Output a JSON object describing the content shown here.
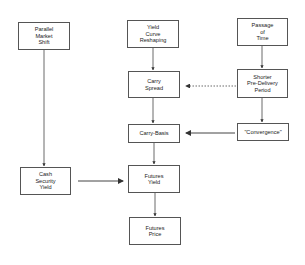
{
  "diagram": {
    "nodes": [
      {
        "id": "parallel",
        "label": "Parallel\nMarket\nShift",
        "x": 18,
        "y": 22,
        "w": 52,
        "h": 28
      },
      {
        "id": "yield_curve",
        "label": "Yield\nCurve\nReshaping",
        "x": 127,
        "y": 20,
        "w": 52,
        "h": 28
      },
      {
        "id": "passage",
        "label": "Passage\nof\nTime",
        "x": 237,
        "y": 18,
        "w": 51,
        "h": 28
      },
      {
        "id": "carry_spread",
        "label": "Carry\nSpread",
        "x": 128,
        "y": 71,
        "w": 52,
        "h": 27
      },
      {
        "id": "shorter",
        "label": "Shorter\nPre-Delivery\nPeriod",
        "x": 237,
        "y": 69,
        "w": 51,
        "h": 29
      },
      {
        "id": "carry_basis",
        "label": "Carry-Basis",
        "x": 128,
        "y": 124,
        "w": 52,
        "h": 19
      },
      {
        "id": "convergence",
        "label": "\"Convergence\"",
        "x": 237,
        "y": 123,
        "w": 52,
        "h": 18
      },
      {
        "id": "cash",
        "label": "Cash\nSecurity\nYield",
        "x": 20,
        "y": 167,
        "w": 51,
        "h": 28
      },
      {
        "id": "futures_yield",
        "label": "Futures\nYield",
        "x": 128,
        "y": 165,
        "w": 52,
        "h": 28
      },
      {
        "id": "futures_price",
        "label": "Futures\nPrice",
        "x": 129,
        "y": 217,
        "w": 52,
        "h": 28
      }
    ],
    "edges": [
      {
        "from": "parallel",
        "to": "cash",
        "style": "solid"
      },
      {
        "from": "yield_curve",
        "to": "carry_spread",
        "style": "solid"
      },
      {
        "from": "passage",
        "to": "shorter",
        "style": "solid"
      },
      {
        "from": "shorter",
        "to": "carry_spread",
        "style": "dotted"
      },
      {
        "from": "carry_spread",
        "to": "carry_basis",
        "style": "solid"
      },
      {
        "from": "shorter",
        "to": "convergence",
        "style": "solid"
      },
      {
        "from": "convergence",
        "to": "carry_basis",
        "style": "solid"
      },
      {
        "from": "carry_basis",
        "to": "futures_yield",
        "style": "solid"
      },
      {
        "from": "cash",
        "to": "futures_yield",
        "style": "solid"
      },
      {
        "from": "futures_yield",
        "to": "futures_price",
        "style": "solid"
      }
    ]
  }
}
